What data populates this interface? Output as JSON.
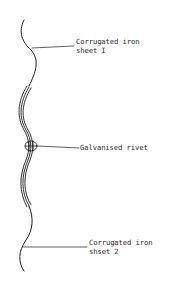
{
  "diagram": {
    "type": "technical-sketch",
    "colors": {
      "line": "#1a1a1a",
      "text": "#2a2a2a",
      "background": "#ffffff"
    },
    "labels": {
      "sheet1": {
        "line1": "Corrugated iron",
        "line2": "sheet I"
      },
      "rivet": {
        "line1": "Galvanised rivet"
      },
      "sheet2": {
        "line1": "Corrugated iron",
        "line2": "shset 2"
      }
    }
  }
}
